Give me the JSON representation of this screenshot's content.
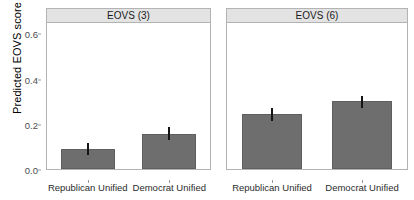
{
  "chart_data": {
    "type": "bar",
    "title": "",
    "xlabel": "",
    "ylabel": "Predicted EOVS score",
    "ylim": [
      0.0,
      0.65
    ],
    "yticks": [
      0.0,
      0.2,
      0.4,
      0.6
    ],
    "ytick_labels": [
      "0.0",
      "0.2",
      "0.4",
      "0.6"
    ],
    "grid": false,
    "legend": "none",
    "bar_color": "#6e6e6e",
    "error_bar_color": "#141414",
    "panel_strip_color": "#e3e3e3",
    "panels": [
      {
        "label": "EOVS (3)",
        "categories": [
          "Republican Unified",
          "Democrat Unified"
        ],
        "values": [
          0.09,
          0.155
        ],
        "error_low": [
          0.065,
          0.133
        ],
        "error_high": [
          0.118,
          0.188
        ]
      },
      {
        "label": "EOVS (6)",
        "categories": [
          "Republican Unified",
          "Democrat Unified"
        ],
        "values": [
          0.245,
          0.3
        ],
        "error_low": [
          0.215,
          0.272
        ],
        "error_high": [
          0.272,
          0.329
        ]
      }
    ]
  },
  "axis": {
    "y_title": "Predicted EOVS score"
  }
}
